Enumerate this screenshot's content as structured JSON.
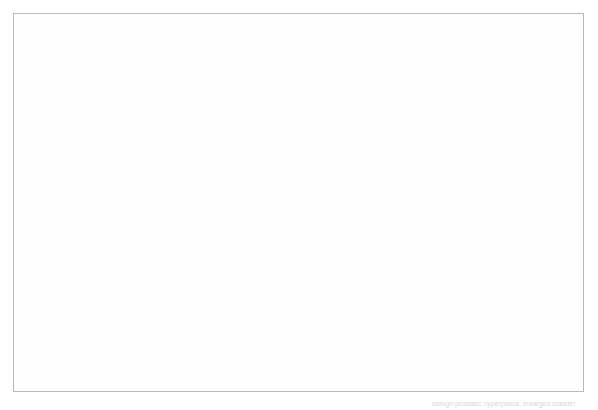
{
  "figure": {
    "type": "medical-illustration",
    "background_color": "#ffffff",
    "frame_border_color": "#b9b9b9",
    "label_text_color": "#3a3a3a",
    "leader_line_color": "#4a4a4a"
  },
  "labels": [
    {
      "id": "bladder",
      "text": "bladder",
      "x": 290,
      "y": 28,
      "leaders": [
        {
          "from_x": 288,
          "from_y": 45,
          "to_x": 190,
          "to_y": 77
        },
        {
          "from_x": 325,
          "from_y": 45,
          "to_x": 405,
          "to_y": 218
        }
      ]
    },
    {
      "id": "normal-prostate",
      "text": "normal\nprostate",
      "line1": "normal",
      "line2": "prostate",
      "x": 235,
      "y": 88,
      "leaders": [
        {
          "from_x": 232,
          "from_y": 108,
          "to_x": 194,
          "to_y": 114
        }
      ]
    },
    {
      "id": "thick-bladder-wall",
      "text": "thick bladder wall",
      "x": 470,
      "y": 57,
      "leaders": [
        {
          "from_x": 483,
          "from_y": 72,
          "to_x": 449,
          "to_y": 172
        }
      ]
    },
    {
      "id": "urethra",
      "text": "urethra",
      "x": 78,
      "y": 319,
      "leaders": [
        {
          "from_x": 98,
          "from_y": 316,
          "to_x": 55,
          "to_y": 192
        }
      ]
    },
    {
      "id": "enlarged-prostate",
      "text": "enlarged prostate",
      "x": 160,
      "y": 367,
      "leaders": [
        {
          "from_x": 262,
          "from_y": 366,
          "to_x": 388,
          "to_y": 334
        }
      ]
    }
  ],
  "inset": {
    "id": "magnifier-circle",
    "center_x": 406,
    "center_y": 231,
    "radius": 172,
    "description": "Circular magnified view of the enlarged prostate obstructing the urethra with a thickened trabeculated bladder wall"
  },
  "small_diagram": {
    "id": "sagittal-overview",
    "description": "Small sagittal section of the male pelvis at upper-left showing bladder, normal prostate, rectum, penis, scrotum and testis"
  },
  "bottom_caption": {
    "text": "benign prostatic hyperplasia, enlarged bladder"
  }
}
